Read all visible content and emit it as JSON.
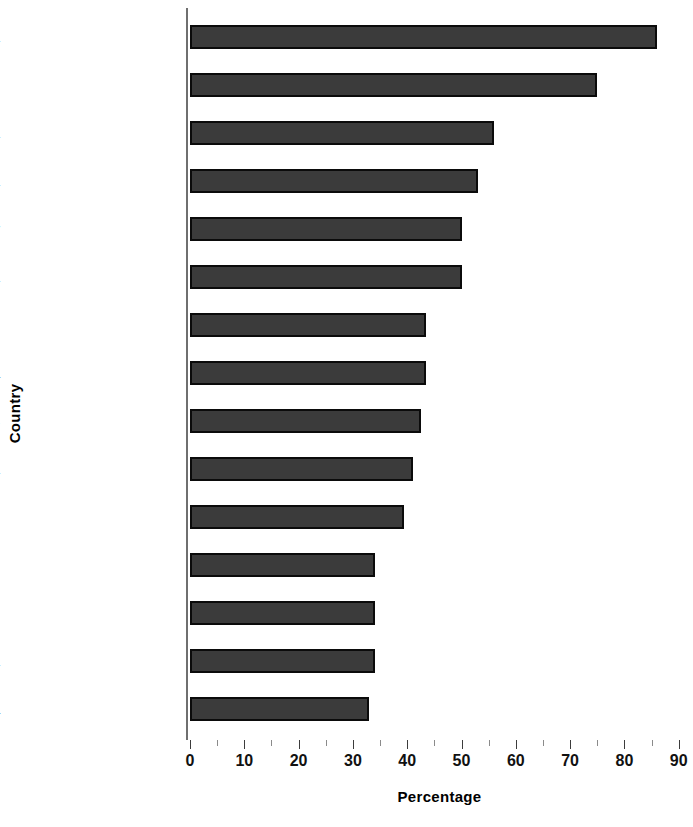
{
  "chart_data": {
    "type": "bar",
    "orientation": "horizontal",
    "title": "",
    "xlabel": "Percentage",
    "ylabel": "Country",
    "xlim": [
      0,
      90
    ],
    "xticks": [
      0,
      10,
      20,
      30,
      40,
      50,
      60,
      70,
      80,
      90
    ],
    "xtick_labels": [
      "0",
      "10",
      "20",
      "30",
      "40",
      "50",
      "60",
      "70",
      "80",
      "90"
    ],
    "grid": false,
    "legend": null,
    "categories": [
      "Slovenia",
      "Poland",
      "Albania",
      "Latvia",
      "Hungary",
      "Czechoslovakia",
      "Uzbekistan",
      "Romania",
      "Belarus",
      "Lithuania",
      "Kazakhstan",
      "Ukraine",
      "Kyrgyzstan",
      "Bulgaria",
      "Estonia"
    ],
    "values": [
      86,
      75,
      56,
      53,
      50,
      50,
      43.5,
      43.5,
      42.5,
      41,
      39.5,
      34,
      34,
      34,
      33
    ],
    "bar_color": "#3b3b3b",
    "bar_border_color": "#0b0b0b",
    "axis_color": "#6f6f6f"
  }
}
